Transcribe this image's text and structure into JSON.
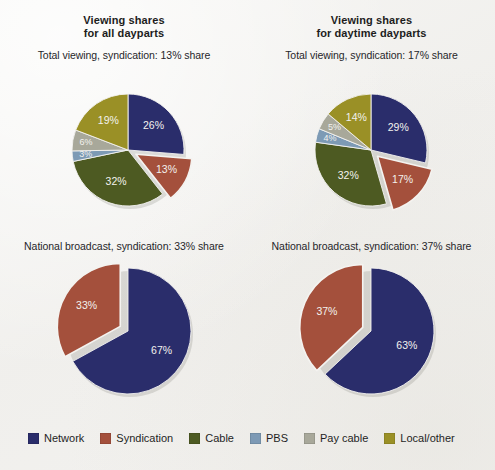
{
  "figure": {
    "background_color": "#f2f1ef",
    "palette": {
      "network": "#2a2d6b",
      "syndication": "#a4503c",
      "cable": "#4d5a22",
      "pbs": "#7d9ab5",
      "pay_cable": "#a8a89a",
      "local_other": "#9a9026",
      "label_text": "#f3f2ee",
      "title_text": "#1d1d1d"
    }
  },
  "panels": {
    "top_left": {
      "title": "Viewing shares\nfor all dayparts",
      "subtitle": "Total viewing, syndication: 13% share"
    },
    "top_right": {
      "title": "Viewing shares\nfor daytime dayparts",
      "subtitle": "Total viewing, syndication: 17% share"
    },
    "bottom_left": {
      "subtitle": "National broadcast, syndication: 33% share"
    },
    "bottom_right": {
      "subtitle": "National broadcast, syndication: 37% share"
    }
  },
  "legend": {
    "position": "bottom",
    "items": [
      {
        "label": "Network",
        "color": "#2a2d6b"
      },
      {
        "label": "Syndication",
        "color": "#a4503c"
      },
      {
        "label": "Cable",
        "color": "#4d5a22"
      },
      {
        "label": "PBS",
        "color": "#7d9ab5"
      },
      {
        "label": "Pay cable",
        "color": "#a8a89a"
      },
      {
        "label": "Local/other",
        "color": "#9a9026"
      }
    ]
  },
  "chart_data": [
    {
      "id": "top_left",
      "type": "pie",
      "title": "Viewing shares for all dayparts",
      "subtitle": "Total viewing, syndication: 13% share",
      "unit": "percent",
      "start_angle_deg": 0,
      "direction": "clockwise",
      "categories": [
        "Network",
        "Syndication",
        "Cable",
        "PBS",
        "Pay cable",
        "Local/other"
      ],
      "values": [
        26,
        13,
        32,
        3,
        6,
        19
      ],
      "labels": [
        "26%",
        "13%",
        "32%",
        "3%",
        "6%",
        "19%"
      ],
      "colors": [
        "#2a2d6b",
        "#a4503c",
        "#4d5a22",
        "#7d9ab5",
        "#a8a89a",
        "#9a9026"
      ],
      "exploded": [
        "Syndication"
      ],
      "legend_position": "bottom",
      "grid": false
    },
    {
      "id": "top_right",
      "type": "pie",
      "title": "Viewing shares for daytime dayparts",
      "subtitle": "Total viewing, syndication: 17% share",
      "unit": "percent",
      "start_angle_deg": 0,
      "direction": "clockwise",
      "categories": [
        "Network",
        "Syndication",
        "Cable",
        "PBS",
        "Pay cable",
        "Local/other"
      ],
      "values": [
        29,
        17,
        32,
        4,
        5,
        14
      ],
      "labels": [
        "29%",
        "17%",
        "32%",
        "4%",
        "5%",
        "14%"
      ],
      "colors": [
        "#2a2d6b",
        "#a4503c",
        "#4d5a22",
        "#7d9ab5",
        "#a8a89a",
        "#9a9026"
      ],
      "exploded": [
        "Syndication"
      ],
      "legend_position": "bottom",
      "grid": false
    },
    {
      "id": "bottom_left",
      "type": "pie",
      "title": "National broadcast, syndication: 33% share",
      "unit": "percent",
      "start_angle_deg": 0,
      "direction": "clockwise",
      "categories": [
        "Network",
        "Syndication"
      ],
      "values": [
        67,
        33
      ],
      "labels": [
        "67%",
        "33%"
      ],
      "colors": [
        "#2a2d6b",
        "#a4503c"
      ],
      "exploded": [
        "Syndication"
      ],
      "legend_position": "bottom",
      "grid": false
    },
    {
      "id": "bottom_right",
      "type": "pie",
      "title": "National broadcast, syndication: 37% share",
      "unit": "percent",
      "start_angle_deg": 0,
      "direction": "clockwise",
      "categories": [
        "Network",
        "Syndication"
      ],
      "values": [
        63,
        37
      ],
      "labels": [
        "63%",
        "37%"
      ],
      "colors": [
        "#2a2d6b",
        "#a4503c"
      ],
      "exploded": [
        "Syndication"
      ],
      "legend_position": "bottom",
      "grid": false
    }
  ]
}
